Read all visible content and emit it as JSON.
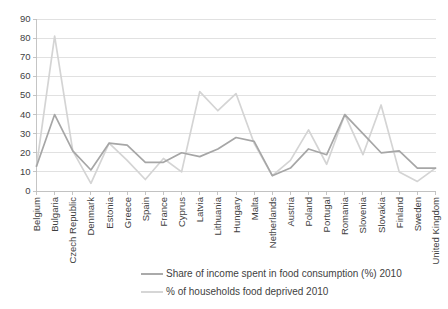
{
  "chart_data": {
    "type": "line",
    "title": "",
    "subtitle": "",
    "xlabel": "",
    "ylabel": "",
    "ylim": [
      0,
      90
    ],
    "ytick_step": 10,
    "yticks": [
      0,
      10,
      20,
      30,
      40,
      50,
      60,
      70,
      80,
      90
    ],
    "ytick_labels": [
      "0",
      "10",
      "20",
      "30",
      "40",
      "50",
      "60",
      "70",
      "80",
      "90"
    ],
    "grid": true,
    "legend_position": "bottom",
    "categories": [
      "Belgium",
      "Bulgaria",
      "Czech Republic",
      "Denmark",
      "Estonia",
      "Greece",
      "Spain",
      "France",
      "Cyprus",
      "Latvia",
      "Lithuania",
      "Hungary",
      "Malta",
      "Netherlands",
      "Austria",
      "Poland",
      "Portugal",
      "Romania",
      "Slovenia",
      "Slovakia",
      "Finland",
      "Sweden",
      "United Kingdom"
    ],
    "series": [
      {
        "name": "Share of income spent in food consumption (%) 2010",
        "color": "#a6a6a6",
        "values": [
          13,
          40,
          21,
          11,
          25,
          24,
          15,
          15,
          20,
          18,
          22,
          28,
          26,
          8,
          12,
          22,
          19,
          40,
          30,
          20,
          21,
          12,
          12
        ]
      },
      {
        "name": "% of households food deprived 2010",
        "color": "#d4d4d4",
        "values": [
          13,
          81,
          21,
          4,
          25,
          16,
          6,
          17,
          10,
          52,
          42,
          51,
          25,
          8,
          16,
          32,
          14,
          40,
          19,
          45,
          10,
          5,
          12
        ]
      }
    ],
    "legend": [
      {
        "label": "Share of income spent in food consumption (%) 2010",
        "color": "#a6a6a6"
      },
      {
        "label": "% of households food deprived 2010",
        "color": "#d4d4d4"
      }
    ]
  }
}
